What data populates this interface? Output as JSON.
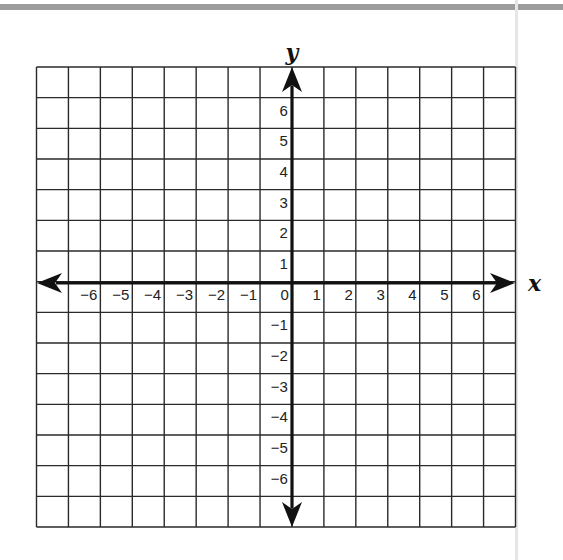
{
  "diagram": {
    "type": "coordinate-plane",
    "x_axis_label": "x",
    "y_axis_label": "y",
    "x_tick_labels": [
      "−6",
      "−5",
      "−4",
      "−3",
      "−2",
      "−1",
      "0",
      "1",
      "2",
      "3",
      "4",
      "5",
      "6"
    ],
    "x_tick_values": [
      -6,
      -5,
      -4,
      -3,
      -2,
      -1,
      0,
      1,
      2,
      3,
      4,
      5,
      6
    ],
    "y_tick_labels": [
      "6",
      "5",
      "4",
      "3",
      "2",
      "1",
      "−1",
      "−2",
      "−3",
      "−4",
      "−5",
      "−6"
    ],
    "y_tick_values": [
      6,
      5,
      4,
      3,
      2,
      1,
      -1,
      -2,
      -3,
      -4,
      -5,
      -6
    ],
    "grid": {
      "columns": 15,
      "rows": 15,
      "x_range": [
        -8,
        7
      ],
      "y_range": [
        -8,
        7
      ]
    },
    "colors": {
      "grid_line": "#2a2a2a",
      "axis": "#111111",
      "top_bar": "#9c9c9c",
      "background": "#ffffff"
    }
  }
}
